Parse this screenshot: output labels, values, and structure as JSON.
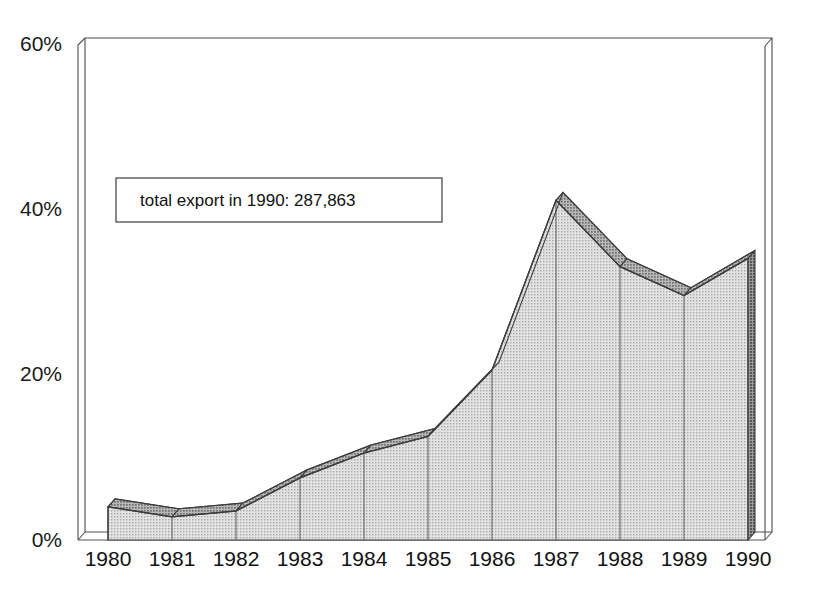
{
  "chart_data": {
    "type": "area",
    "title": "",
    "subtitle": "",
    "xlabel": "",
    "ylabel": "",
    "categories": [
      "1980",
      "1981",
      "1982",
      "1983",
      "1984",
      "1985",
      "1986",
      "1987",
      "1988",
      "1989",
      "1990"
    ],
    "values": [
      4.0,
      2.8,
      3.5,
      7.5,
      10.5,
      12.5,
      20.5,
      41.0,
      33.0,
      29.5,
      34.0
    ],
    "series": [
      {
        "name": "share of total export",
        "values": [
          4.0,
          2.8,
          3.5,
          7.5,
          10.5,
          12.5,
          20.5,
          41.0,
          33.0,
          29.5,
          34.0
        ]
      }
    ],
    "ylim": [
      0,
      60
    ],
    "yticks": [
      0,
      20,
      40,
      60
    ],
    "ytick_labels": [
      "0%",
      "20%",
      "40%",
      "60%"
    ],
    "xtick_labels": [
      "1980",
      "1981",
      "1982",
      "1983",
      "1984",
      "1985",
      "1986",
      "1987",
      "1988",
      "1989",
      "1990"
    ],
    "grid": false,
    "legend": "none",
    "style": "3d-area",
    "annotations": [
      {
        "id": "total-export-note",
        "text": "total export in 1990: 287,863"
      }
    ],
    "colors": {
      "area_front": "#c9c9c9",
      "area_top": "#8f8f8f",
      "area_side": "#6e6e6e",
      "outline": "#3d3d3d",
      "frame": "#4d4d4d",
      "text": "#111111",
      "background": "#ffffff"
    }
  },
  "axes": {
    "y": {
      "ticks": [
        {
          "label": "60%",
          "value": 60
        },
        {
          "label": "40%",
          "value": 40
        },
        {
          "label": "20%",
          "value": 20
        },
        {
          "label": "0%",
          "value": 0
        }
      ]
    },
    "x": {
      "ticks": [
        {
          "label": "1980"
        },
        {
          "label": "1981"
        },
        {
          "label": "1982"
        },
        {
          "label": "1983"
        },
        {
          "label": "1984"
        },
        {
          "label": "1985"
        },
        {
          "label": "1986"
        },
        {
          "label": "1987"
        },
        {
          "label": "1988"
        },
        {
          "label": "1989"
        },
        {
          "label": "1990"
        }
      ]
    }
  },
  "annotation": {
    "text": "total export in 1990: 287,863"
  }
}
